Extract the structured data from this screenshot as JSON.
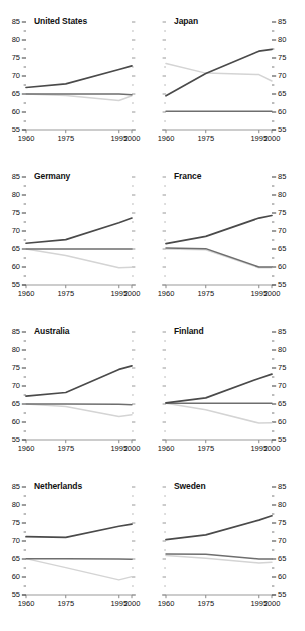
{
  "chart_data": {
    "type": "line",
    "title": "",
    "xlabel": "",
    "ylabel": "",
    "x": [
      1960,
      1975,
      1995,
      2000
    ],
    "xlim": [
      1960,
      2000
    ],
    "ylim": [
      55,
      85
    ],
    "y_ticks": [
      55,
      60,
      65,
      70,
      75,
      80,
      85
    ],
    "y_minor_ticks": [
      57.5,
      62.5,
      67.5,
      72.5,
      77.5,
      82.5
    ],
    "x_ticks": [
      1960,
      1975,
      1995,
      2000
    ],
    "x_tick_labels": [
      "1960",
      "1975",
      "1995",
      "2000"
    ],
    "y_tick_labels": [
      "55",
      "60",
      "65",
      "70",
      "75",
      "80",
      "85"
    ],
    "grid": false,
    "legend": "none",
    "left_axis_panels": [
      "United States",
      "Germany",
      "Australia",
      "Netherlands"
    ],
    "right_axis_panels": [
      "Japan",
      "France",
      "Finland",
      "Sweden"
    ],
    "series_colors": {
      "dark": "#4a4a4a",
      "mid": "#6e6e6e",
      "light": "#d4d4d4"
    },
    "series_names": [
      "dark",
      "mid",
      "light"
    ],
    "panels": [
      {
        "name": "United States",
        "axis_side": "left",
        "series": [
          {
            "name": "dark",
            "values": [
              66.8,
              67.8,
              71.8,
              72.8
            ]
          },
          {
            "name": "mid",
            "values": [
              65.0,
              65.0,
              65.0,
              64.8
            ]
          },
          {
            "name": "light",
            "values": [
              65.0,
              64.6,
              63.2,
              64.5
            ]
          }
        ]
      },
      {
        "name": "Japan",
        "axis_side": "right",
        "series": [
          {
            "name": "dark",
            "values": [
              64.5,
              70.7,
              76.9,
              77.4
            ]
          },
          {
            "name": "mid",
            "values": [
              60.2,
              60.2,
              60.2,
              60.2
            ]
          },
          {
            "name": "light",
            "values": [
              73.5,
              70.8,
              70.4,
              68.6
            ]
          }
        ]
      },
      {
        "name": "Germany",
        "axis_side": "left",
        "series": [
          {
            "name": "dark",
            "values": [
              66.6,
              67.6,
              72.3,
              73.6
            ]
          },
          {
            "name": "mid",
            "values": [
              65.0,
              65.0,
              65.0,
              65.0
            ]
          },
          {
            "name": "light",
            "values": [
              65.0,
              63.2,
              59.8,
              59.9
            ]
          }
        ]
      },
      {
        "name": "France",
        "axis_side": "right",
        "series": [
          {
            "name": "dark",
            "values": [
              66.5,
              68.5,
              73.6,
              74.3
            ]
          },
          {
            "name": "mid",
            "values": [
              65.3,
              65.1,
              60.0,
              60.0
            ]
          },
          {
            "name": "light",
            "values": [
              65.0,
              64.8,
              59.8,
              59.8
            ]
          }
        ]
      },
      {
        "name": "Australia",
        "axis_side": "left",
        "series": [
          {
            "name": "dark",
            "values": [
              67.2,
              68.2,
              74.6,
              75.6
            ]
          },
          {
            "name": "mid",
            "values": [
              65.0,
              65.0,
              64.9,
              64.8
            ]
          },
          {
            "name": "light",
            "values": [
              65.0,
              64.3,
              61.5,
              62.0
            ]
          }
        ]
      },
      {
        "name": "Finland",
        "axis_side": "right",
        "series": [
          {
            "name": "dark",
            "values": [
              65.3,
              66.7,
              72.1,
              73.3
            ]
          },
          {
            "name": "mid",
            "values": [
              65.2,
              65.2,
              65.2,
              65.2
            ]
          },
          {
            "name": "light",
            "values": [
              65.2,
              63.4,
              59.7,
              59.8
            ]
          }
        ]
      },
      {
        "name": "Netherlands",
        "axis_side": "left",
        "series": [
          {
            "name": "dark",
            "values": [
              71.2,
              71.0,
              74.1,
              74.7
            ]
          },
          {
            "name": "mid",
            "values": [
              65.1,
              65.1,
              65.0,
              64.9
            ]
          },
          {
            "name": "light",
            "values": [
              65.1,
              62.6,
              59.2,
              60.1
            ]
          }
        ]
      },
      {
        "name": "Sweden",
        "axis_side": "right",
        "series": [
          {
            "name": "dark",
            "values": [
              70.4,
              71.7,
              75.8,
              77.0
            ]
          },
          {
            "name": "mid",
            "values": [
              66.4,
              66.3,
              65.0,
              65.0
            ]
          },
          {
            "name": "light",
            "values": [
              66.0,
              65.2,
              63.9,
              64.1
            ]
          }
        ]
      }
    ]
  }
}
